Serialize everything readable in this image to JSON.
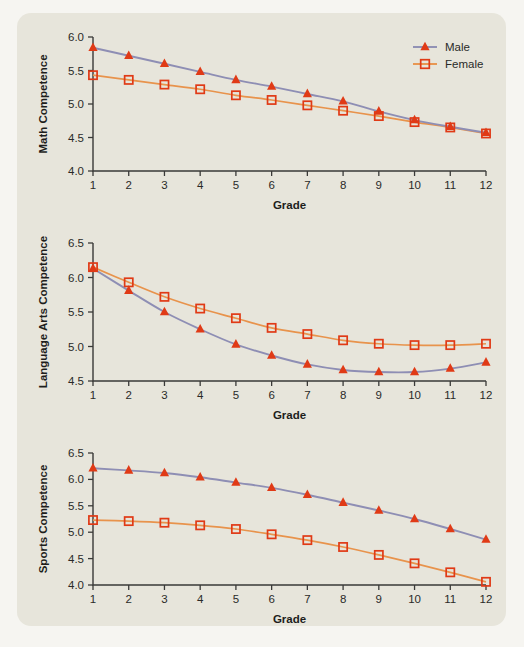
{
  "figure": {
    "background_color": "#f6f5f1",
    "panel_color": "#e7e5db",
    "male_line_color": "#8e8eb4",
    "female_line_color": "#e8934c",
    "marker_color": "#e03a16"
  },
  "legend": {
    "position": "top-right",
    "entries": [
      {
        "label": "Male",
        "marker": "triangle-filled",
        "line_color": "#8e8eb4"
      },
      {
        "label": "Female",
        "marker": "square-open",
        "line_color": "#e8934c"
      }
    ]
  },
  "chart_data": [
    {
      "type": "line",
      "title": "",
      "xlabel": "Grade",
      "ylabel": "Math Competence",
      "x": [
        1,
        2,
        3,
        4,
        5,
        6,
        7,
        8,
        9,
        10,
        11,
        12
      ],
      "xticklabels": [
        "1",
        "2",
        "3",
        "4",
        "5",
        "6",
        "7",
        "8",
        "9",
        "10",
        "11",
        "12"
      ],
      "ylim": [
        4.0,
        6.0
      ],
      "yticks": [
        4.0,
        4.5,
        5.0,
        5.5,
        6.0
      ],
      "yticklabels": [
        "4.0",
        "4.5",
        "5.0",
        "5.5",
        "6.0"
      ],
      "grid": false,
      "series": [
        {
          "name": "Male",
          "values": [
            5.84,
            5.72,
            5.6,
            5.48,
            5.36,
            5.26,
            5.15,
            5.04,
            4.89,
            4.76,
            4.66,
            4.57
          ]
        },
        {
          "name": "Female",
          "values": [
            5.43,
            5.36,
            5.29,
            5.22,
            5.13,
            5.06,
            4.98,
            4.9,
            4.82,
            4.73,
            4.65,
            4.56
          ]
        }
      ]
    },
    {
      "type": "line",
      "title": "",
      "xlabel": "Grade",
      "ylabel": "Language Arts Competence",
      "x": [
        1,
        2,
        3,
        4,
        5,
        6,
        7,
        8,
        9,
        10,
        11,
        12
      ],
      "xticklabels": [
        "1",
        "2",
        "3",
        "4",
        "5",
        "6",
        "7",
        "8",
        "9",
        "10",
        "11",
        "12"
      ],
      "ylim": [
        4.5,
        6.5
      ],
      "yticks": [
        4.5,
        5.0,
        5.5,
        6.0,
        6.5
      ],
      "yticklabels": [
        "4.5",
        "5.0",
        "5.5",
        "6.0",
        "6.5"
      ],
      "grid": false,
      "series": [
        {
          "name": "Male",
          "values": [
            6.13,
            5.81,
            5.5,
            5.25,
            5.03,
            4.87,
            4.74,
            4.66,
            4.63,
            4.63,
            4.68,
            4.77
          ]
        },
        {
          "name": "Female",
          "values": [
            6.15,
            5.93,
            5.72,
            5.55,
            5.41,
            5.27,
            5.18,
            5.09,
            5.04,
            5.02,
            5.02,
            5.04
          ]
        }
      ]
    },
    {
      "type": "line",
      "title": "",
      "xlabel": "Grade",
      "ylabel": "Sports Competence",
      "x": [
        1,
        2,
        3,
        4,
        5,
        6,
        7,
        8,
        9,
        10,
        11,
        12
      ],
      "xticklabels": [
        "1",
        "2",
        "3",
        "4",
        "5",
        "6",
        "7",
        "8",
        "9",
        "10",
        "11",
        "12"
      ],
      "ylim": [
        4.0,
        6.5
      ],
      "yticks": [
        4.0,
        4.5,
        5.0,
        5.5,
        6.0,
        6.5
      ],
      "yticklabels": [
        "4.0",
        "4.5",
        "5.0",
        "5.5",
        "6.0",
        "6.5"
      ],
      "grid": false,
      "series": [
        {
          "name": "Male",
          "values": [
            6.21,
            6.17,
            6.12,
            6.04,
            5.94,
            5.84,
            5.71,
            5.56,
            5.41,
            5.25,
            5.06,
            4.86
          ]
        },
        {
          "name": "Female",
          "values": [
            5.23,
            5.21,
            5.18,
            5.13,
            5.06,
            4.96,
            4.85,
            4.72,
            4.57,
            4.41,
            4.24,
            4.06
          ]
        }
      ]
    }
  ]
}
